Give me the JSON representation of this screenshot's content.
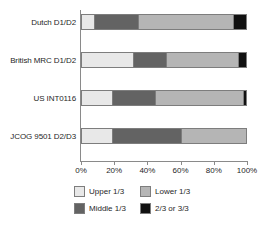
{
  "chart_data": {
    "type": "bar",
    "orientation": "horizontal",
    "stacked": true,
    "stack_mode": "percent",
    "title": "",
    "subtitle": "",
    "xlabel": "",
    "ylabel": "",
    "xlim": [
      0,
      100
    ],
    "xticks": [
      0,
      20,
      40,
      60,
      80,
      100
    ],
    "xtick_labels": [
      "0%",
      "20%",
      "40%",
      "60%",
      "80%",
      "100%"
    ],
    "grid": false,
    "legend_position": "bottom",
    "categories": [
      "Dutch D1/D2",
      "British MRC D1/D2",
      "US INT0116",
      "JCOG 9501 D2/D3"
    ],
    "series": [
      {
        "name": "Upper 1/3",
        "color": "#e8e8e8",
        "values": [
          8,
          32,
          19,
          19
        ]
      },
      {
        "name": "Middle 1/3",
        "color": "#636363",
        "values": [
          27,
          20,
          26,
          42
        ]
      },
      {
        "name": "Lower 1/3",
        "color": "#b5b5b5",
        "values": [
          58,
          44,
          53.5,
          39
        ]
      },
      {
        "name": "2/3 or 3/3",
        "color": "#111111",
        "values": [
          7,
          4,
          1.5,
          0
        ]
      }
    ]
  },
  "axis": {
    "tick_labels": [
      "0%",
      "20%",
      "40%",
      "60%",
      "80%",
      "100%"
    ]
  },
  "legend": {
    "items": [
      {
        "label": "Upper 1/3",
        "color": "#e8e8e8"
      },
      {
        "label": "Lower 1/3",
        "color": "#b5b5b5"
      },
      {
        "label": "Middle 1/3",
        "color": "#636363"
      },
      {
        "label": "2/3 or 3/3",
        "color": "#111111"
      }
    ]
  }
}
